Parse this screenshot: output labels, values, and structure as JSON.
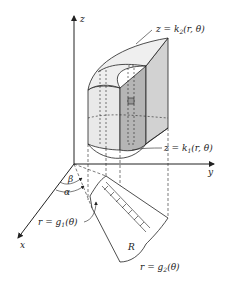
{
  "diagram": {
    "axes": {
      "z": "z",
      "y": "y",
      "x": "x"
    },
    "labels": {
      "top_surface": "z = k",
      "top_surface_sub": "2",
      "top_surface_args": "(r, θ)",
      "bottom_surface": "z = k",
      "bottom_surface_sub": "1",
      "bottom_surface_args": "(r, θ)",
      "inner_curve": "r = g",
      "inner_curve_sub": "1",
      "inner_curve_args": "(θ)",
      "outer_curve": "r = g",
      "outer_curve_sub": "2",
      "outer_curve_args": "(θ)",
      "region": "R",
      "angle_beta": "β",
      "angle_alpha": "α"
    },
    "colors": {
      "line": "#222222",
      "shade_light": "#e6e6e6",
      "shade_mid": "#cfcfcf",
      "shade_dark": "#a9a9a9"
    }
  }
}
